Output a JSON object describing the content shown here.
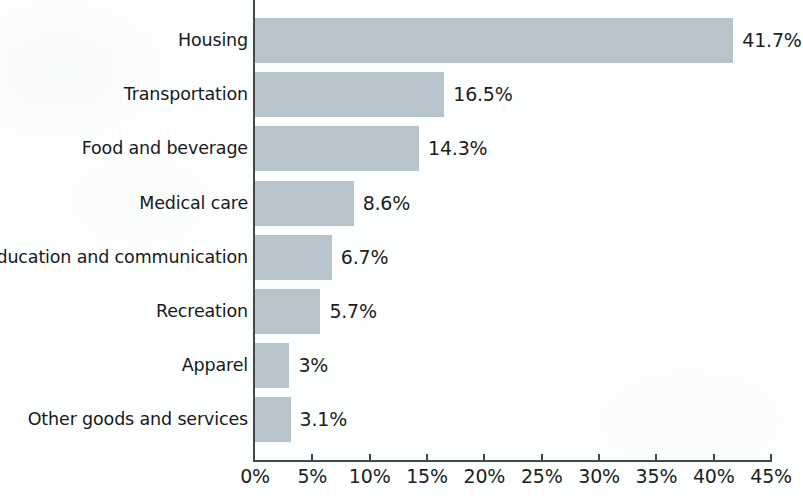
{
  "chart_data": {
    "type": "bar",
    "orientation": "horizontal",
    "title": "",
    "subtitle": "",
    "xlabel": "",
    "ylabel": "",
    "xlim": [
      0,
      45
    ],
    "grid": false,
    "legend": null,
    "value_suffix": "%",
    "xticks": [
      "0%",
      "5%",
      "10%",
      "15%",
      "20%",
      "25%",
      "30%",
      "35%",
      "40%",
      "45%"
    ],
    "xtick_values": [
      0,
      5,
      10,
      15,
      20,
      25,
      30,
      35,
      40,
      45
    ],
    "categories": [
      "Housing",
      "Transportation",
      "Food and beverage",
      "Medical care",
      "Education and communication",
      "Recreation",
      "Apparel",
      "Other goods and services"
    ],
    "values": [
      41.7,
      16.5,
      14.3,
      8.6,
      6.7,
      5.7,
      3.0,
      3.1
    ],
    "value_labels": [
      "41.7%",
      "16.5%",
      "14.3%",
      "8.6%",
      "6.7%",
      "5.7%",
      "3%",
      "3.1%"
    ],
    "colors": {
      "bar": "#b7c4cc",
      "axis": "#43484b",
      "text": "#1d1f21",
      "background": "#ffffff"
    }
  }
}
